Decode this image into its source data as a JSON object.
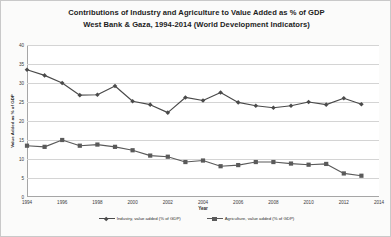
{
  "chart_data": {
    "type": "line",
    "title": "Contributions of Industry and Agriculture to Value Added as % of GDP",
    "subtitle": "West Bank & Gaza, 1994-2014 (World Development Indicators)",
    "title_lines": [
      "Contributions of Industry and Agriculture to Value Added as % of GDP",
      "West Bank & Gaza, 1994-2014 (World Development Indicators)"
    ],
    "xlabel": "Year",
    "ylabel": "Value Added as % of GDP",
    "xlim": [
      1994,
      2014
    ],
    "ylim": [
      0,
      40
    ],
    "grid": true,
    "legend_position": "bottom",
    "x": [
      1994,
      1995,
      1996,
      1997,
      1998,
      1999,
      2000,
      2001,
      2002,
      2003,
      2004,
      2005,
      2006,
      2007,
      2008,
      2009,
      2010,
      2011,
      2012,
      2013
    ],
    "xticks": [
      "1994",
      "1996",
      "1998",
      "2000",
      "2002",
      "2004",
      "2006",
      "2008",
      "2010",
      "2012",
      "2014"
    ],
    "xtick_values": [
      1994,
      1996,
      1998,
      2000,
      2002,
      2004,
      2006,
      2008,
      2010,
      2012,
      2014
    ],
    "yticks": [
      "0",
      "5",
      "10",
      "15",
      "20",
      "25",
      "30",
      "35",
      "40"
    ],
    "ytick_values": [
      0,
      5,
      10,
      15,
      20,
      25,
      30,
      35,
      40
    ],
    "series": [
      {
        "name": "Industry, value added (% of GDP)",
        "color": "#4a4a4a",
        "marker": "diamond",
        "values": [
          33.5,
          32.0,
          30.0,
          26.8,
          26.9,
          29.2,
          25.2,
          24.3,
          22.2,
          26.2,
          25.4,
          27.5,
          24.9,
          24.0,
          23.5,
          24.0,
          25.0,
          24.3,
          26.0,
          24.4
        ]
      },
      {
        "name": "Agriculture, value added (% of GDP)",
        "color": "#5a5a5a",
        "marker": "square",
        "values": [
          13.5,
          13.2,
          15.0,
          13.5,
          13.8,
          13.2,
          12.3,
          10.9,
          10.6,
          9.2,
          9.6,
          8.1,
          8.4,
          9.2,
          9.2,
          8.8,
          8.5,
          8.7,
          6.2,
          5.6
        ]
      }
    ]
  }
}
